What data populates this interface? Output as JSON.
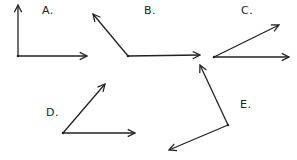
{
  "diagram": {
    "stroke_color": "#222222",
    "angles": [
      {
        "label": "A.",
        "label_pos": [
          42,
          4
        ],
        "vertex": [
          18,
          56
        ],
        "ray1": [
          18,
          5
        ],
        "ray2": [
          87,
          56
        ]
      },
      {
        "label": "B.",
        "label_pos": [
          144,
          4
        ],
        "vertex": [
          128,
          56
        ],
        "ray1": [
          93,
          14
        ],
        "ray2": [
          200,
          55
        ]
      },
      {
        "label": "C.",
        "label_pos": [
          241,
          4
        ],
        "vertex": [
          214,
          57
        ],
        "ray1": [
          279,
          25
        ],
        "ray2": [
          289,
          57
        ]
      },
      {
        "label": "D.",
        "label_pos": [
          46,
          106
        ],
        "vertex": [
          63,
          133
        ],
        "ray1": [
          105,
          84
        ],
        "ray2": [
          135,
          133
        ]
      },
      {
        "label": "E.",
        "label_pos": [
          240,
          98
        ],
        "vertex": [
          228,
          125
        ],
        "ray1": [
          200,
          65
        ],
        "ray2": [
          169,
          150
        ]
      }
    ]
  }
}
